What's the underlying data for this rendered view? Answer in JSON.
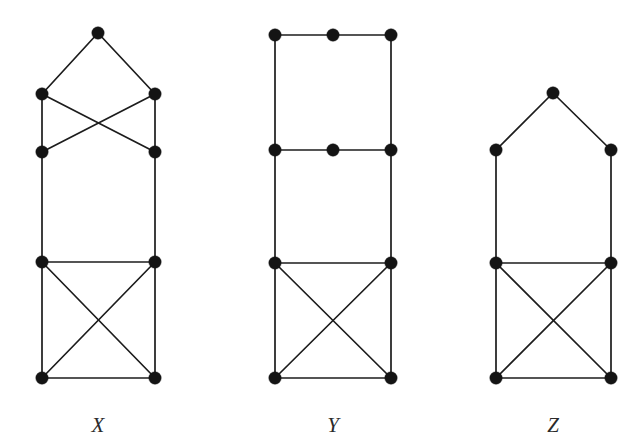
{
  "figure": {
    "background_color": "#ffffff",
    "node_color": "#141414",
    "edge_color": "#1c1c1c",
    "node_radius": 6.2,
    "edge_width": 1.7,
    "width": 644,
    "height": 447
  },
  "graphs": [
    {
      "id": "X",
      "label": "X",
      "label_x": 98,
      "label_y": 415,
      "node_count": 7,
      "edge_count": 12,
      "nodes": [
        {
          "id": "x0",
          "name": "apex",
          "x": 98,
          "y": 33
        },
        {
          "id": "x1",
          "name": "upper-left",
          "x": 42,
          "y": 94
        },
        {
          "id": "x2",
          "name": "upper-right",
          "x": 155,
          "y": 94
        },
        {
          "id": "x3",
          "name": "second-left",
          "x": 42,
          "y": 152
        },
        {
          "id": "x4",
          "name": "second-right",
          "x": 155,
          "y": 152
        },
        {
          "id": "x5",
          "name": "third-left",
          "x": 42,
          "y": 262
        },
        {
          "id": "x6",
          "name": "third-right",
          "x": 155,
          "y": 262
        },
        {
          "id": "x7",
          "name": "bottom-left",
          "x": 42,
          "y": 378
        },
        {
          "id": "x8",
          "name": "bottom-right",
          "x": 155,
          "y": 378
        }
      ],
      "edges": [
        [
          "x0",
          "x1"
        ],
        [
          "x0",
          "x2"
        ],
        [
          "x1",
          "x3"
        ],
        [
          "x2",
          "x4"
        ],
        [
          "x1",
          "x4"
        ],
        [
          "x2",
          "x3"
        ],
        [
          "x3",
          "x5"
        ],
        [
          "x4",
          "x6"
        ],
        [
          "x5",
          "x6"
        ],
        [
          "x5",
          "x7"
        ],
        [
          "x6",
          "x8"
        ],
        [
          "x5",
          "x8"
        ],
        [
          "x6",
          "x7"
        ],
        [
          "x7",
          "x8"
        ]
      ]
    },
    {
      "id": "Y",
      "label": "Y",
      "label_x": 333,
      "label_y": 415,
      "node_count": 8,
      "edge_count": 12,
      "nodes": [
        {
          "id": "y0",
          "name": "top-left",
          "x": 275,
          "y": 35
        },
        {
          "id": "y1",
          "name": "top-middle",
          "x": 333,
          "y": 35
        },
        {
          "id": "y2",
          "name": "top-right",
          "x": 391,
          "y": 35
        },
        {
          "id": "y3",
          "name": "second-left",
          "x": 275,
          "y": 150
        },
        {
          "id": "y4",
          "name": "second-middle",
          "x": 333,
          "y": 150
        },
        {
          "id": "y5",
          "name": "second-right",
          "x": 391,
          "y": 150
        },
        {
          "id": "y6",
          "name": "third-left",
          "x": 275,
          "y": 263
        },
        {
          "id": "y7",
          "name": "third-right",
          "x": 391,
          "y": 263
        },
        {
          "id": "y8",
          "name": "bottom-left",
          "x": 275,
          "y": 378
        },
        {
          "id": "y9",
          "name": "bottom-right",
          "x": 391,
          "y": 378
        }
      ],
      "edges": [
        [
          "y0",
          "y1"
        ],
        [
          "y1",
          "y2"
        ],
        [
          "y0",
          "y3"
        ],
        [
          "y2",
          "y5"
        ],
        [
          "y3",
          "y4"
        ],
        [
          "y4",
          "y5"
        ],
        [
          "y3",
          "y6"
        ],
        [
          "y5",
          "y7"
        ],
        [
          "y6",
          "y7"
        ],
        [
          "y6",
          "y8"
        ],
        [
          "y7",
          "y9"
        ],
        [
          "y6",
          "y9"
        ],
        [
          "y7",
          "y8"
        ],
        [
          "y8",
          "y9"
        ]
      ]
    },
    {
      "id": "Z",
      "label": "Z",
      "label_x": 553,
      "label_y": 415,
      "node_count": 7,
      "edge_count": 11,
      "nodes": [
        {
          "id": "z0",
          "name": "apex",
          "x": 553,
          "y": 93
        },
        {
          "id": "z1",
          "name": "upper-left",
          "x": 496,
          "y": 150
        },
        {
          "id": "z2",
          "name": "upper-right",
          "x": 611,
          "y": 150
        },
        {
          "id": "z3",
          "name": "middle-left",
          "x": 496,
          "y": 263
        },
        {
          "id": "z4",
          "name": "middle-right",
          "x": 611,
          "y": 263
        },
        {
          "id": "z5",
          "name": "bottom-left",
          "x": 496,
          "y": 378
        },
        {
          "id": "z6",
          "name": "bottom-right",
          "x": 611,
          "y": 378
        }
      ],
      "edges": [
        [
          "z0",
          "z1"
        ],
        [
          "z0",
          "z2"
        ],
        [
          "z1",
          "z3"
        ],
        [
          "z2",
          "z4"
        ],
        [
          "z3",
          "z4"
        ],
        [
          "z3",
          "z5"
        ],
        [
          "z4",
          "z6"
        ],
        [
          "z3",
          "z6"
        ],
        [
          "z4",
          "z5"
        ],
        [
          "z5",
          "z6"
        ]
      ]
    }
  ]
}
